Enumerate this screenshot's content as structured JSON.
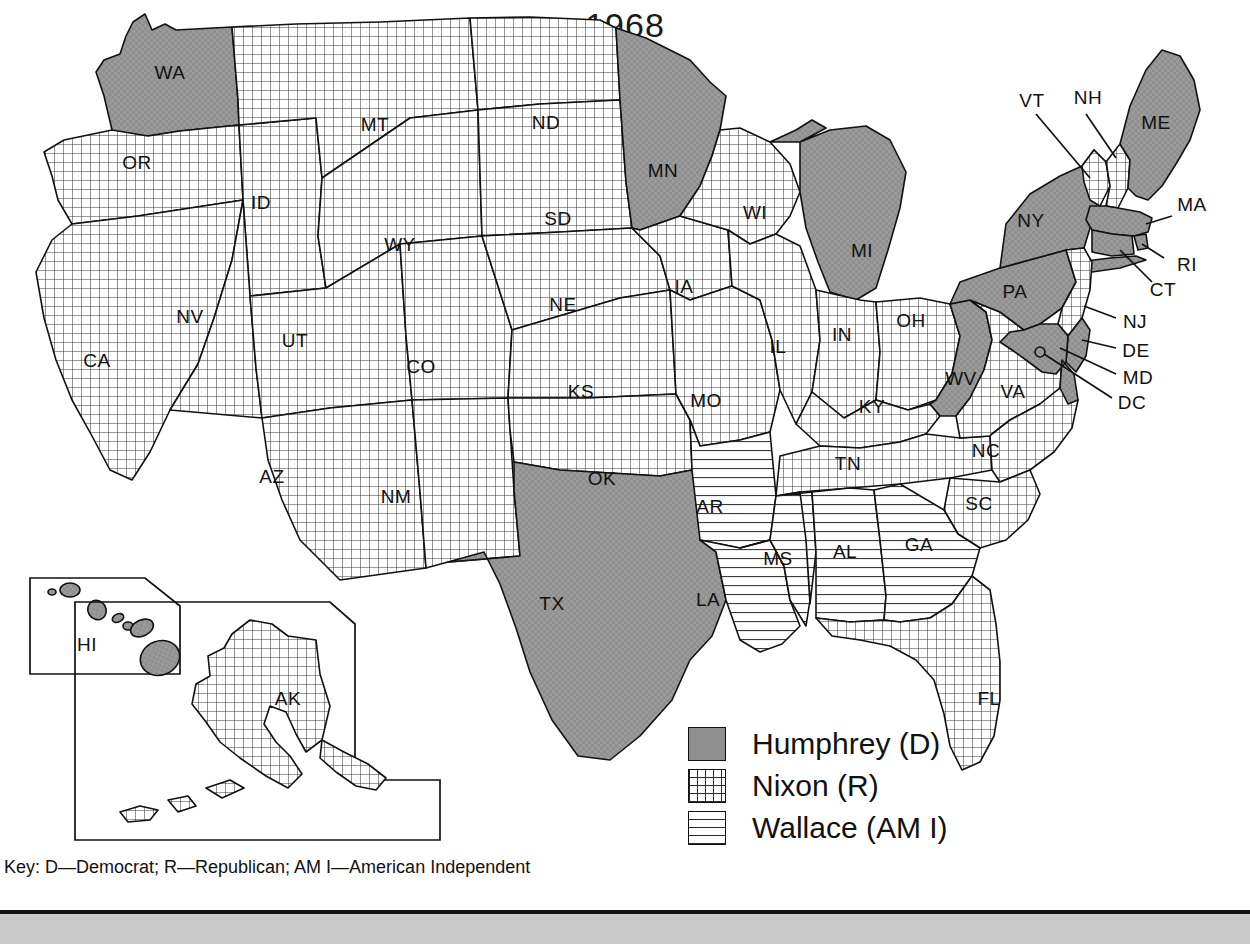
{
  "figure": {
    "title": "1968",
    "key_text": "Key:  D—Democrat; R—Republican; AM I—American Independent"
  },
  "legend": {
    "items": [
      {
        "label": "Humphrey (D)",
        "pattern": "solid-gray",
        "color": "#8f8f8f"
      },
      {
        "label": "Nixon (R)",
        "pattern": "cross-grid",
        "color": "#ffffff"
      },
      {
        "label": "Wallace (AM I)",
        "pattern": "horizontal-lines",
        "color": "#ffffff"
      }
    ]
  },
  "map_data": {
    "type": "choropleth-categorical",
    "title": "1968",
    "regions": "US states electoral college winners, 1968 presidential election",
    "categories": [
      "Humphrey (D)",
      "Nixon (R)",
      "Wallace (AM I)"
    ],
    "states": [
      {
        "abbr": "WA",
        "winner": "Humphrey (D)"
      },
      {
        "abbr": "OR",
        "winner": "Nixon (R)"
      },
      {
        "abbr": "CA",
        "winner": "Nixon (R)"
      },
      {
        "abbr": "ID",
        "winner": "Nixon (R)"
      },
      {
        "abbr": "NV",
        "winner": "Nixon (R)"
      },
      {
        "abbr": "MT",
        "winner": "Nixon (R)"
      },
      {
        "abbr": "WY",
        "winner": "Nixon (R)"
      },
      {
        "abbr": "UT",
        "winner": "Nixon (R)"
      },
      {
        "abbr": "AZ",
        "winner": "Nixon (R)"
      },
      {
        "abbr": "CO",
        "winner": "Nixon (R)"
      },
      {
        "abbr": "NM",
        "winner": "Nixon (R)"
      },
      {
        "abbr": "ND",
        "winner": "Nixon (R)"
      },
      {
        "abbr": "SD",
        "winner": "Nixon (R)"
      },
      {
        "abbr": "NE",
        "winner": "Nixon (R)"
      },
      {
        "abbr": "KS",
        "winner": "Nixon (R)"
      },
      {
        "abbr": "OK",
        "winner": "Nixon (R)"
      },
      {
        "abbr": "TX",
        "winner": "Humphrey (D)"
      },
      {
        "abbr": "MN",
        "winner": "Humphrey (D)"
      },
      {
        "abbr": "IA",
        "winner": "Nixon (R)"
      },
      {
        "abbr": "MO",
        "winner": "Nixon (R)"
      },
      {
        "abbr": "AR",
        "winner": "Wallace (AM I)"
      },
      {
        "abbr": "LA",
        "winner": "Wallace (AM I)"
      },
      {
        "abbr": "WI",
        "winner": "Nixon (R)"
      },
      {
        "abbr": "IL",
        "winner": "Nixon (R)"
      },
      {
        "abbr": "MS",
        "winner": "Wallace (AM I)"
      },
      {
        "abbr": "MI",
        "winner": "Humphrey (D)"
      },
      {
        "abbr": "IN",
        "winner": "Nixon (R)"
      },
      {
        "abbr": "KY",
        "winner": "Nixon (R)"
      },
      {
        "abbr": "TN",
        "winner": "Nixon (R)"
      },
      {
        "abbr": "AL",
        "winner": "Wallace (AM I)"
      },
      {
        "abbr": "OH",
        "winner": "Nixon (R)"
      },
      {
        "abbr": "WV",
        "winner": "Humphrey (D)"
      },
      {
        "abbr": "VA",
        "winner": "Nixon (R)"
      },
      {
        "abbr": "NC",
        "winner": "Nixon (R)"
      },
      {
        "abbr": "SC",
        "winner": "Nixon (R)"
      },
      {
        "abbr": "GA",
        "winner": "Wallace (AM I)"
      },
      {
        "abbr": "FL",
        "winner": "Nixon (R)"
      },
      {
        "abbr": "PA",
        "winner": "Humphrey (D)"
      },
      {
        "abbr": "NY",
        "winner": "Humphrey (D)"
      },
      {
        "abbr": "VT",
        "winner": "Nixon (R)"
      },
      {
        "abbr": "NH",
        "winner": "Nixon (R)"
      },
      {
        "abbr": "ME",
        "winner": "Humphrey (D)"
      },
      {
        "abbr": "MA",
        "winner": "Humphrey (D)"
      },
      {
        "abbr": "RI",
        "winner": "Humphrey (D)"
      },
      {
        "abbr": "CT",
        "winner": "Humphrey (D)"
      },
      {
        "abbr": "NJ",
        "winner": "Nixon (R)"
      },
      {
        "abbr": "DE",
        "winner": "Humphrey (D)"
      },
      {
        "abbr": "MD",
        "winner": "Humphrey (D)"
      },
      {
        "abbr": "DC",
        "winner": "Humphrey (D)"
      },
      {
        "abbr": "HI",
        "winner": "Humphrey (D)"
      },
      {
        "abbr": "AK",
        "winner": "Nixon (R)"
      }
    ]
  },
  "labels": {
    "WA": "WA",
    "OR": "OR",
    "CA": "CA",
    "ID": "ID",
    "NV": "NV",
    "MT": "MT",
    "WY": "WY",
    "UT": "UT",
    "AZ": "AZ",
    "CO": "CO",
    "NM": "NM",
    "ND": "ND",
    "SD": "SD",
    "NE": "NE",
    "KS": "KS",
    "OK": "OK",
    "TX": "TX",
    "MN": "MN",
    "IA": "IA",
    "MO": "MO",
    "AR": "AR",
    "LA": "LA",
    "WI": "WI",
    "IL": "IL",
    "MS": "MS",
    "MI": "MI",
    "IN": "IN",
    "KY": "KY",
    "TN": "TN",
    "AL": "AL",
    "OH": "OH",
    "WV": "WV",
    "VA": "VA",
    "NC": "NC",
    "SC": "SC",
    "GA": "GA",
    "FL": "FL",
    "PA": "PA",
    "NY": "NY",
    "VT": "VT",
    "NH": "NH",
    "ME": "ME",
    "MA": "MA",
    "RI": "RI",
    "CT": "CT",
    "NJ": "NJ",
    "DE": "DE",
    "MD": "MD",
    "DC": "DC",
    "HI": "HI",
    "AK": "AK"
  }
}
